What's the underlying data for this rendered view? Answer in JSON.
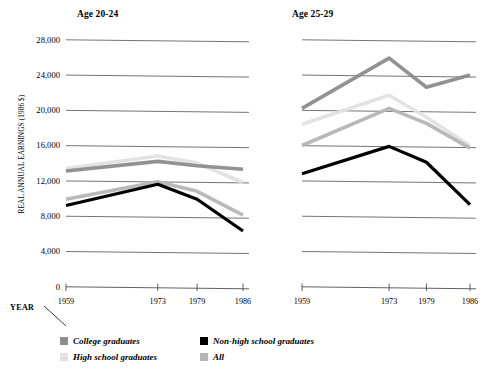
{
  "axis": {
    "y_title": "REAL ANNUAL EARNINGS (1986 $)",
    "x_title": "YEAR",
    "y_ticks": [
      "0",
      "4,000",
      "8,000",
      "12,000",
      "16,000",
      "20,000",
      "24,000",
      "28,000"
    ],
    "x_ticks": [
      "1959",
      "1973",
      "1979",
      "1986"
    ]
  },
  "panels": [
    {
      "title": "Age 20-24"
    },
    {
      "title": "Age 25-29"
    }
  ],
  "legend": [
    {
      "label": "College graduates",
      "color": "#8c8c8c"
    },
    {
      "label": "High school graduates",
      "color": "#e2e2e2"
    },
    {
      "label": "Non-high school graduates",
      "color": "#000000"
    },
    {
      "label": "All",
      "color": "#b5b5b5"
    }
  ],
  "chart_data": {
    "type": "line",
    "xlabel": "YEAR",
    "ylabel": "REAL ANNUAL EARNINGS (1986 $)",
    "x": [
      1959,
      1973,
      1979,
      1986
    ],
    "ylim": [
      0,
      28000
    ],
    "ytick_values": [
      0,
      4000,
      8000,
      12000,
      16000,
      20000,
      24000,
      28000
    ],
    "grid": "horizontal",
    "legend_position": "bottom-left",
    "panels": [
      {
        "name": "Age 20-24",
        "series": [
          {
            "name": "College graduates",
            "color": "#8c8c8c",
            "values": [
              13200,
              14300,
              13800,
              13400
            ]
          },
          {
            "name": "High school graduates",
            "color": "#e2e2e2",
            "values": [
              13500,
              14900,
              14100,
              11900
            ]
          },
          {
            "name": "All",
            "color": "#b5b5b5",
            "values": [
              10000,
              12000,
              10900,
              8200
            ]
          },
          {
            "name": "Non-high school graduates",
            "color": "#000000",
            "values": [
              9300,
              11700,
              10000,
              6400
            ]
          }
        ]
      },
      {
        "name": "Age 25-29",
        "series": [
          {
            "name": "College graduates",
            "color": "#8c8c8c",
            "values": [
              20300,
              26000,
              22700,
              24100
            ]
          },
          {
            "name": "High school graduates",
            "color": "#e2e2e2",
            "values": [
              18500,
              21800,
              19300,
              16100
            ]
          },
          {
            "name": "All",
            "color": "#b5b5b5",
            "values": [
              16100,
              20300,
              18600,
              15800
            ]
          },
          {
            "name": "Non-high school graduates",
            "color": "#000000",
            "values": [
              12900,
              16000,
              14200,
              9400
            ]
          }
        ]
      }
    ]
  }
}
